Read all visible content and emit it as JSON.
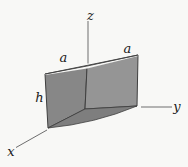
{
  "figure": {
    "type": "3d-geometry-diagram",
    "axis_labels": {
      "x": "x",
      "y": "y",
      "z": "z"
    },
    "edge_labels": {
      "top_left_edge": "a",
      "top_right_edge": "a",
      "height_edge": "h"
    },
    "colors": {
      "background": "#f8f8f6",
      "face_left": "#878787",
      "face_right": "#959595",
      "face_bottom": "#7e7e7e",
      "face_top": "#d8d8d8",
      "edge_stroke": "#3f3f3f",
      "axis_stroke": "#6e6e6e",
      "label_color": "#1a1a1a",
      "highlight": "#f6f6f4"
    }
  }
}
